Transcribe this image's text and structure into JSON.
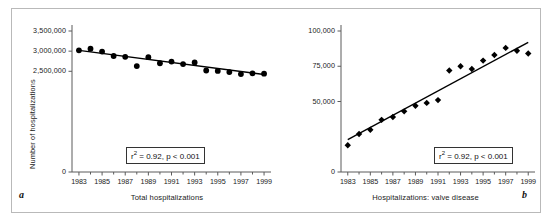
{
  "figure": {
    "background_color": "#ffffff",
    "frame_color": "#b9b9b9",
    "marker_color": "#000000",
    "line_color": "#000000"
  },
  "chart_data": [
    {
      "type": "scatter",
      "panel_letter": "a",
      "title": "",
      "xlabel": "Total hospitalizations",
      "ylabel": "Number of hospitalizations",
      "annotation": "r² = 0.92, p < 0.001",
      "r_squared": 0.92,
      "p_value": "p < 0.001",
      "marker": "circle",
      "grid": false,
      "legend": "none",
      "xlim": [
        1982.4,
        1999.6
      ],
      "ylim": [
        0,
        3500000
      ],
      "ytick_values": [
        0,
        2500000,
        3000000,
        3500000
      ],
      "ytick_labels": [
        "0",
        "2,500,000",
        "3,000,000",
        "3,500,000"
      ],
      "xtick_values": [
        1983,
        1985,
        1987,
        1989,
        1991,
        1993,
        1995,
        1997,
        1999
      ],
      "xtick_labels": [
        "1983",
        "1985",
        "1987",
        "1989",
        "1991",
        "1993",
        "1995",
        "1997",
        "1999"
      ],
      "xtick_minor_values": [
        1984,
        1986,
        1988,
        1990,
        1992,
        1994,
        1996,
        1998
      ],
      "x": [
        1983,
        1984,
        1985,
        1986,
        1987,
        1988,
        1989,
        1990,
        1991,
        1992,
        1993,
        1994,
        1995,
        1996,
        1997,
        1998,
        1999
      ],
      "values": [
        3020000,
        3060000,
        2990000,
        2880000,
        2860000,
        2630000,
        2850000,
        2700000,
        2740000,
        2680000,
        2720000,
        2520000,
        2510000,
        2480000,
        2430000,
        2450000,
        2440000
      ],
      "trendline": {
        "x": [
          1983,
          1999
        ],
        "y": [
          3020000,
          2420000
        ]
      }
    },
    {
      "type": "scatter",
      "panel_letter": "b",
      "title": "",
      "xlabel": "Hospitalizations: valve disease",
      "ylabel": "",
      "annotation": "r² = 0.92, p < 0.001",
      "r_squared": 0.92,
      "p_value": "p < 0.001",
      "marker": "diamond",
      "grid": false,
      "legend": "none",
      "xlim": [
        1982.4,
        1999.6
      ],
      "ylim": [
        0,
        100000
      ],
      "ytick_values": [
        0,
        50000,
        75000,
        100000
      ],
      "ytick_labels": [
        "0",
        "50,000",
        "75,000",
        "100,000"
      ],
      "xtick_values": [
        1983,
        1985,
        1987,
        1989,
        1991,
        1993,
        1995,
        1997,
        1999
      ],
      "xtick_labels": [
        "1983",
        "1985",
        "1987",
        "1989",
        "1991",
        "1993",
        "1995",
        "1997",
        "1999"
      ],
      "xtick_minor_values": [
        1984,
        1986,
        1988,
        1990,
        1992,
        1994,
        1996,
        1998
      ],
      "x": [
        1983,
        1984,
        1985,
        1986,
        1987,
        1988,
        1989,
        1990,
        1991,
        1992,
        1993,
        1994,
        1995,
        1996,
        1997,
        1998,
        1999
      ],
      "values": [
        19000,
        27000,
        30000,
        37000,
        39000,
        43000,
        47000,
        49000,
        51000,
        72000,
        75000,
        73000,
        79000,
        83000,
        88000,
        86000,
        84000
      ],
      "trendline": {
        "x": [
          1983,
          1999
        ],
        "y": [
          23000,
          92000
        ]
      }
    }
  ]
}
